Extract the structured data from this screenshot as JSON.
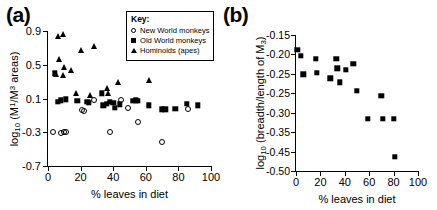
{
  "figure": {
    "panels": [
      {
        "id": "a",
        "label": "(a)",
        "legend": {
          "title": "Key:",
          "entries": [
            {
              "marker": "open-circle-icon",
              "label": "New World monkeys"
            },
            {
              "marker": "filled-square-icon",
              "label": "Old World monkeys"
            },
            {
              "marker": "filled-triangle-icon",
              "label": "Hominoids (apes)"
            }
          ]
        }
      },
      {
        "id": "b",
        "label": "(b)"
      }
    ]
  },
  "chart_data": [
    {
      "type": "scatter",
      "panel": "a",
      "title": "(a)",
      "xlabel": "% leaves in diet",
      "ylabel": "log10 (M1/M3 areas)",
      "ylabel_parts": {
        "prefix": "log",
        "sub1": "10",
        "open": " (M",
        "sup1": "1",
        "slash": "/M",
        "sup2": "3",
        "tail": " areas)"
      },
      "xlim": [
        0,
        100
      ],
      "ylim": [
        -0.7,
        0.9
      ],
      "xticks": [
        0,
        20,
        40,
        60,
        80,
        100
      ],
      "yticks": [
        0.9,
        0.5,
        0.1,
        -0.3,
        -0.7
      ],
      "ytick_labels": [
        "0.9",
        "0.5",
        "0.1",
        "-0.3",
        "-0.7"
      ],
      "xtick_labels": [
        "0",
        "20",
        "40",
        "60",
        "80",
        "100"
      ],
      "grid": false,
      "legend_position": "top-right",
      "series": [
        {
          "name": "New World monkeys",
          "marker": "open-circle",
          "points": [
            [
              3,
              -0.3
            ],
            [
              8,
              -0.31
            ],
            [
              10,
              -0.3
            ],
            [
              11,
              -0.3
            ],
            [
              21,
              -0.04
            ],
            [
              22,
              -0.05
            ],
            [
              28,
              0.08
            ],
            [
              38,
              -0.3
            ],
            [
              45,
              0.08
            ],
            [
              49,
              -0.01
            ],
            [
              55,
              -0.18
            ],
            [
              70,
              -0.42
            ],
            [
              86,
              -0.02
            ]
          ]
        },
        {
          "name": "Old World monkeys",
          "marker": "filled-square",
          "points": [
            [
              4,
              0.4
            ],
            [
              6,
              0.06
            ],
            [
              8,
              0.08
            ],
            [
              11,
              0.09
            ],
            [
              18,
              0.07
            ],
            [
              24,
              0.06
            ],
            [
              25,
              0.05
            ],
            [
              33,
              0.16
            ],
            [
              34,
              0.02
            ],
            [
              36,
              0.04
            ],
            [
              38,
              0.06
            ],
            [
              40,
              0.05
            ],
            [
              41,
              -0.01
            ],
            [
              44,
              0.03
            ],
            [
              52,
              0.07
            ],
            [
              54,
              0.08
            ],
            [
              55,
              0.07
            ],
            [
              62,
              0.02
            ],
            [
              70,
              -0.03
            ],
            [
              72,
              -0.03
            ],
            [
              78,
              -0.02
            ],
            [
              85,
              0.04
            ],
            [
              92,
              0.02
            ]
          ]
        },
        {
          "name": "Hominoids (apes)",
          "marker": "filled-triangle",
          "points": [
            [
              6,
              0.84
            ],
            [
              9,
              0.87
            ],
            [
              7,
              0.57
            ],
            [
              10,
              0.47
            ],
            [
              5,
              0.39
            ],
            [
              9,
              0.38
            ],
            [
              14,
              0.44
            ],
            [
              20,
              0.68
            ],
            [
              28,
              0.72
            ],
            [
              17,
              0.16
            ],
            [
              26,
              0.14
            ],
            [
              36,
              0.22
            ],
            [
              37,
              0.17
            ],
            [
              43,
              0.29
            ],
            [
              62,
              0.32
            ]
          ]
        }
      ]
    },
    {
      "type": "scatter",
      "panel": "b",
      "title": "(b)",
      "xlabel": "% leaves in diet",
      "ylabel": "log10 (breadth/length of M3)",
      "ylabel_parts": {
        "prefix": "log",
        "sub1": "10",
        "mid": " (breadth/length of M",
        "sub2": "3",
        "tail": ")"
      },
      "xlim": [
        0,
        100
      ],
      "ylim": [
        -0.5,
        -0.15
      ],
      "xticks": [
        0,
        20,
        40,
        60,
        80,
        100
      ],
      "xtick_labels": [
        "0",
        "20",
        "40",
        "60",
        "80",
        "100"
      ],
      "ytick_labels": [
        "-0.15",
        "-0.20",
        "-0.25",
        "-0.25",
        "-0.30",
        "-0.35",
        "-0.45",
        "-0.50"
      ],
      "ytick_values": [
        -0.15,
        -0.2,
        -0.25,
        -0.275,
        -0.3,
        -0.35,
        -0.45,
        -0.5
      ],
      "grid": false,
      "series": [
        {
          "name": "Old World monkeys",
          "marker": "filled-square",
          "points": [
            [
              1,
              -0.188
            ],
            [
              4,
              -0.203
            ],
            [
              6,
              -0.251
            ],
            [
              16,
              -0.212
            ],
            [
              17,
              -0.248
            ],
            [
              28,
              -0.261
            ],
            [
              33,
              -0.212
            ],
            [
              34,
              -0.236
            ],
            [
              36,
              -0.272
            ],
            [
              41,
              -0.24
            ],
            [
              47,
              -0.224
            ],
            [
              50,
              -0.294
            ],
            [
              59,
              -0.365
            ],
            [
              70,
              -0.307
            ],
            [
              71,
              -0.366
            ],
            [
              80,
              -0.366
            ],
            [
              81,
              -0.464
            ]
          ]
        }
      ]
    }
  ]
}
